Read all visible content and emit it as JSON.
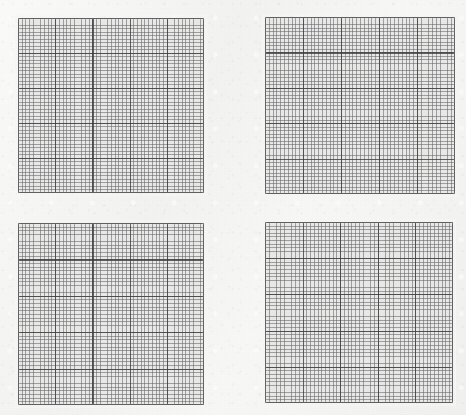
{
  "page": {
    "background_color": "#f6f6f5",
    "width": 466,
    "height": 415
  },
  "style": {
    "panel_fill": "#e9e9e8",
    "major_line_color": "#3c3c3e",
    "minor_line_color": "#606064",
    "frame_color": "#303032"
  },
  "panels": [
    {
      "id": "panel-top-left",
      "label": "Top left grid",
      "x": 18,
      "y": 18,
      "width": 186,
      "height": 175,
      "major_cells_x": 5,
      "major_cells_y": 5,
      "minor_per_major": 10
    },
    {
      "id": "panel-top-right",
      "label": "Top right grid",
      "x": 265,
      "y": 17,
      "width": 190,
      "height": 177,
      "major_cells_x": 5,
      "major_cells_y": 5,
      "minor_per_major": 10
    },
    {
      "id": "panel-bottom-left",
      "label": "Bottom left grid",
      "x": 18,
      "y": 223,
      "width": 186,
      "height": 182,
      "major_cells_x": 5,
      "major_cells_y": 5,
      "minor_per_major": 10
    },
    {
      "id": "panel-bottom-right",
      "label": "Bottom right grid",
      "x": 265,
      "y": 222,
      "width": 188,
      "height": 181,
      "major_cells_x": 5,
      "major_cells_y": 5,
      "minor_per_major": 10
    }
  ]
}
